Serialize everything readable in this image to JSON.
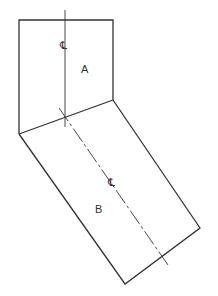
{
  "diagram": {
    "colors": {
      "line": "#333333",
      "background": "#ffffff"
    },
    "parts": [
      {
        "id": "A",
        "label": "A",
        "shape": "upper square section",
        "centerline_label": "CL"
      },
      {
        "id": "B",
        "label": "B",
        "shape": "lower angled rectangular section",
        "centerline_label": "CL"
      }
    ],
    "symbols": {
      "centerline": "℄"
    }
  }
}
